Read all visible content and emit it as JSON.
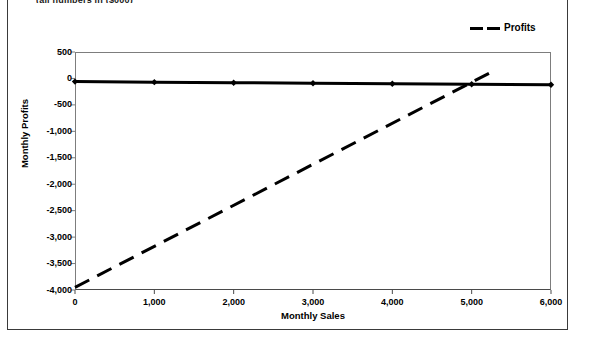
{
  "caption": "(all numbers in ($000)",
  "legend": {
    "position": "top-right",
    "entries": [
      {
        "label": "Profits",
        "style": "dashed",
        "color": "#000000"
      }
    ]
  },
  "axis_titles": {
    "x": "Monthly Sales",
    "y": "Monthly Profits"
  },
  "ticks": {
    "y": [
      "500",
      "0",
      "-500",
      "-1,000",
      "-1,500",
      "-2,000",
      "-2,500",
      "-3,000",
      "-3,500",
      "-4,000"
    ],
    "x": [
      "0",
      "1,000",
      "2,000",
      "3,000",
      "4,000",
      "5,000",
      "6,000"
    ]
  },
  "chart_data": {
    "type": "line",
    "title": "(all numbers in ($000)",
    "xlabel": "Monthly Sales",
    "ylabel": "Monthly Profits",
    "xlim": [
      0,
      6000
    ],
    "ylim": [
      -4000,
      500
    ],
    "ytick_values": [
      500,
      0,
      -500,
      -1000,
      -1500,
      -2000,
      -2500,
      -3000,
      -3500,
      -4000
    ],
    "xtick_values": [
      0,
      1000,
      2000,
      3000,
      4000,
      5000,
      6000
    ],
    "grid": false,
    "legend_position": "top-right",
    "series": [
      {
        "name": "Breakeven",
        "style": "solid",
        "linewidth": 3,
        "marker": "diamond",
        "color": "#000000",
        "in_legend": false,
        "x": [
          0,
          1000,
          2000,
          3000,
          4000,
          5000,
          6000
        ],
        "values": [
          -60,
          -70,
          -80,
          -90,
          -100,
          -110,
          -120
        ]
      },
      {
        "name": "Profits",
        "style": "dashed",
        "linewidth": 3,
        "marker": "none",
        "color": "#000000",
        "in_legend": true,
        "x": [
          0,
          5300
        ],
        "values": [
          -3950,
          160
        ]
      }
    ]
  }
}
